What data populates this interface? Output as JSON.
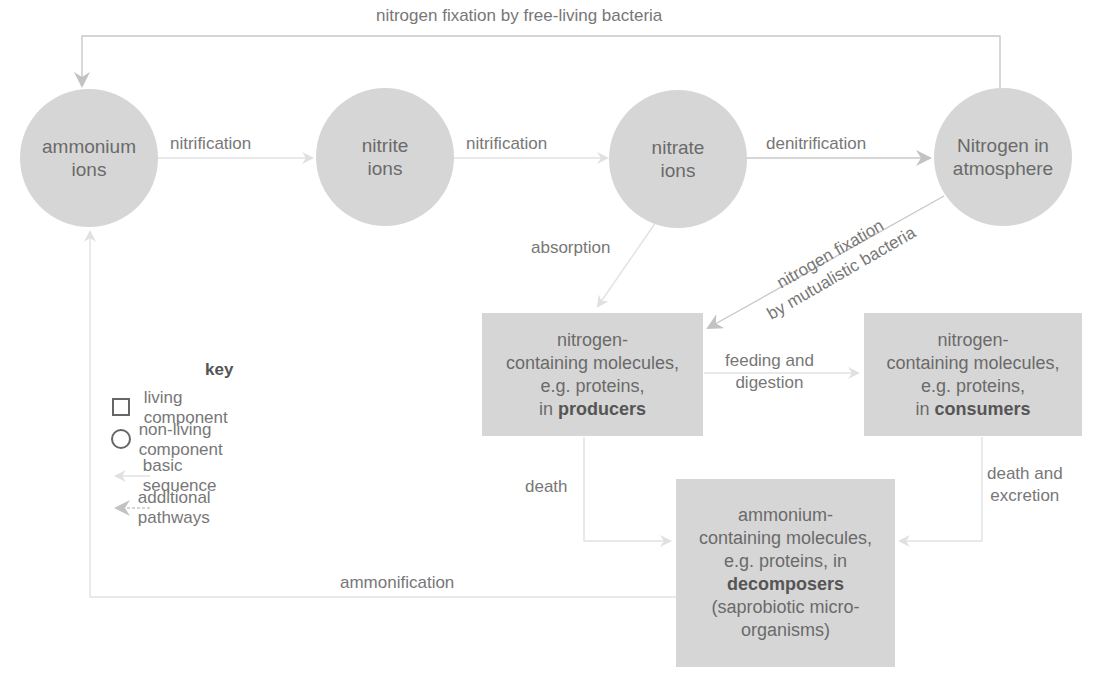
{
  "diagram": {
    "nodes": {
      "ammonium_ions": {
        "line1": "ammonium",
        "line2": "ions",
        "shape": "circle"
      },
      "nitrite_ions": {
        "line1": "nitrite",
        "line2": "ions",
        "shape": "circle"
      },
      "nitrate_ions": {
        "line1": "nitrate",
        "line2": "ions",
        "shape": "circle"
      },
      "nitrogen_atmosphere": {
        "line1": "Nitrogen in",
        "line2": "atmosphere",
        "shape": "circle"
      },
      "producers": {
        "line1": "nitrogen-",
        "line2": "containing molecules,",
        "line3": "e.g. proteins,",
        "line4_prefix": "in ",
        "line4_bold": "producers",
        "shape": "square"
      },
      "consumers": {
        "line1": "nitrogen-",
        "line2": "containing molecules,",
        "line3": "e.g. proteins,",
        "line4_prefix": "in ",
        "line4_bold": "consumers",
        "shape": "square"
      },
      "decomposers": {
        "line1": "ammonium-",
        "line2": "containing molecules,",
        "line3": "e.g. proteins, in",
        "line4_bold": "decomposers",
        "line5": "(saprobiotic micro-",
        "line6": "organisms)",
        "shape": "square"
      }
    },
    "edges": {
      "fixation_free_living": "nitrogen fixation by free-living bacteria",
      "nitrification_1": "nitrification",
      "nitrification_2": "nitrification",
      "denitrification": "denitrification",
      "absorption": "absorption",
      "fixation_mutualistic_1": "nitrogen fixation",
      "fixation_mutualistic_2": "by mutualistic bacteria",
      "feeding_1": "feeding and",
      "feeding_2": "digestion",
      "death": "death",
      "death_excretion_1": "death and",
      "death_excretion_2": "excretion",
      "ammonification": "ammonification"
    },
    "key": {
      "title": "key",
      "items": [
        {
          "symbol": "square",
          "label": "living component"
        },
        {
          "symbol": "circle",
          "label": "non-living component"
        },
        {
          "symbol": "light-arrow",
          "label": "basic sequence"
        },
        {
          "symbol": "dark-arrow",
          "label": "additional pathways"
        }
      ]
    },
    "colors": {
      "node_fill": "#d6d6d6",
      "basic_arrow": "#e2e2e2",
      "additional_arrow": "#c4c4c4",
      "text": "#6f6f6f"
    }
  }
}
